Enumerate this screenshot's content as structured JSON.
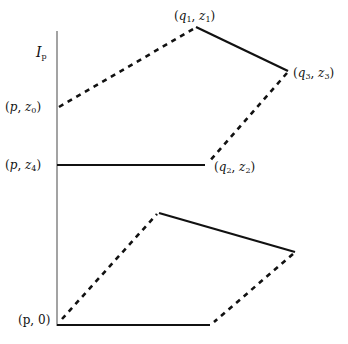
{
  "diagram": {
    "axis_label": {
      "base": "I",
      "sub": "p"
    },
    "points": {
      "p_z0": {
        "open": "(",
        "a": "p",
        "sep": ", ",
        "b": "z",
        "b_sub": "0",
        "close": ")"
      },
      "q1_z1": {
        "open": "(",
        "a": "q",
        "a_sub": "1",
        "sep": ", ",
        "b": "z",
        "b_sub": "1",
        "close": ")"
      },
      "q3_z3": {
        "open": "(",
        "a": "q",
        "a_sub": "3",
        "sep": ", ",
        "b": "z",
        "b_sub": "3",
        "close": ")"
      },
      "p_z4": {
        "open": "(",
        "a": "p",
        "sep": ", ",
        "b": "z",
        "b_sub": "4",
        "close": ")"
      },
      "q2_z2": {
        "open": "(",
        "a": "q",
        "a_sub": "2",
        "sep": ", ",
        "b": "z",
        "b_sub": "2",
        "close": ")"
      },
      "p_0": {
        "text": "(p, 0)"
      }
    },
    "upper_shape": {
      "solid_edges": [
        [
          "q1_z1",
          "q3_z3"
        ],
        [
          "p_z4",
          "q2_z2"
        ]
      ],
      "dashed_edges": [
        [
          "p_z0",
          "q1_z1"
        ],
        [
          "q3_z3",
          "q2_z2"
        ]
      ]
    },
    "lower_shape": {
      "solid_edges": [
        "top-to-right",
        "bottom (p,0) to bottom-right"
      ],
      "dashed_edges": [
        "(p,0) to top",
        "right to bottom-right"
      ]
    },
    "colors": {
      "line": "#111111",
      "axis": "#555555",
      "background": "#ffffff"
    }
  }
}
